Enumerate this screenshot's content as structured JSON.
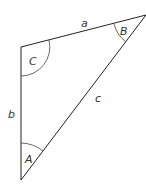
{
  "diagram": {
    "type": "triangle",
    "vertices": {
      "A": [
        21,
        180
      ],
      "B": [
        146,
        15
      ],
      "C": [
        21,
        47
      ]
    },
    "angle_labels": {
      "A": "A",
      "B": "B",
      "C": "C"
    },
    "side_labels": {
      "a": "a",
      "b": "b",
      "c": "c"
    },
    "stroke_color": "#222222"
  }
}
